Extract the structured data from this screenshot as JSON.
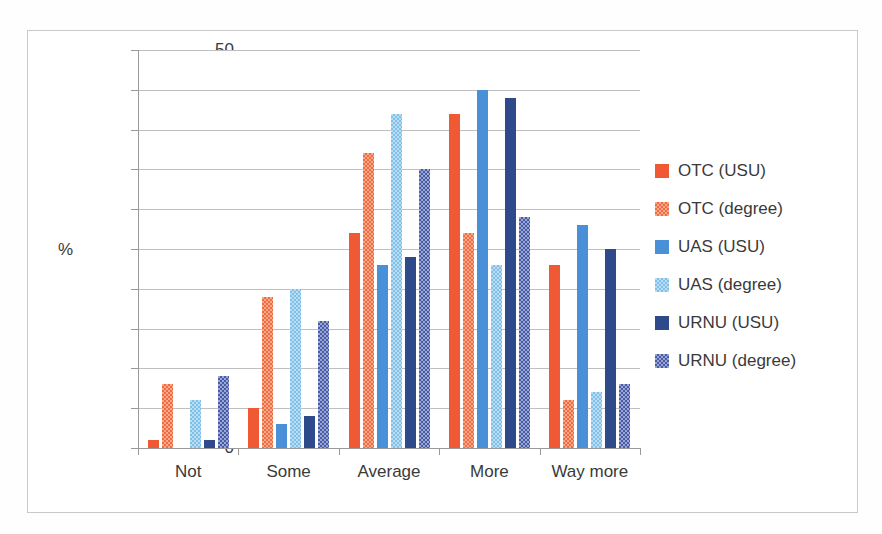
{
  "chart_data": {
    "type": "bar",
    "title": "",
    "xlabel": "",
    "ylabel": "%",
    "ylim": [
      0,
      50
    ],
    "ytick_step": 5,
    "yticks": [
      50,
      45,
      40,
      35,
      30,
      25,
      20,
      15,
      10,
      5,
      0
    ],
    "grid": true,
    "legend_position": "right",
    "categories": [
      "Not",
      "Some",
      "Average",
      "More",
      "Way more"
    ],
    "series": [
      {
        "name": "OTC (USU)",
        "color": "#ef5a35",
        "pattern": "solid",
        "values": [
          1,
          5,
          27,
          42,
          23
        ]
      },
      {
        "name": "OTC (degree)",
        "color": "#f7a98a",
        "pattern": "checkerboard",
        "values": [
          8,
          19,
          37,
          27,
          6
        ]
      },
      {
        "name": "UAS (USU)",
        "color": "#4a90d9",
        "pattern": "solid",
        "values": [
          0,
          3,
          23,
          45,
          28
        ]
      },
      {
        "name": "UAS (degree)",
        "color": "#bcdcf2",
        "pattern": "checkerboard",
        "values": [
          6,
          20,
          42,
          23,
          7
        ]
      },
      {
        "name": "URNU (USU)",
        "color": "#2e4a8b",
        "pattern": "solid",
        "values": [
          1,
          4,
          24,
          44,
          25
        ]
      },
      {
        "name": "URNU (degree)",
        "color": "#9aa6d4",
        "pattern": "checkerboard",
        "values": [
          9,
          16,
          35,
          29,
          8
        ]
      }
    ]
  },
  "axis": {
    "y_label": "%"
  },
  "colors": {
    "grid": "#bfbfbf",
    "axis": "#9a9a9a",
    "text": "#3a3a3a",
    "border": "#c9c9c9",
    "background": "#ffffff"
  }
}
